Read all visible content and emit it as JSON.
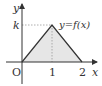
{
  "diagram": {
    "axes": {
      "x_label": "x",
      "y_label": "y",
      "origin_label": "O"
    },
    "ticks": {
      "x": [
        "1",
        "2"
      ],
      "y": [
        "k"
      ]
    },
    "function_label": "y=f(x)",
    "shape": {
      "type": "triangle",
      "vertices": [
        {
          "x": 0,
          "y": 0
        },
        {
          "x": 1,
          "y": "k"
        },
        {
          "x": 2,
          "y": 0
        }
      ],
      "fill_color": "#e6e6e6",
      "stroke_color": "#333333"
    },
    "guides": {
      "horizontal_dashed": "y=k from x=0 to x=1",
      "vertical_dashed": "x=1 from y=0 to y=k"
    },
    "colors": {
      "axis": "#333333",
      "fill": "#e6e6e6",
      "dashed": "#999999"
    }
  }
}
